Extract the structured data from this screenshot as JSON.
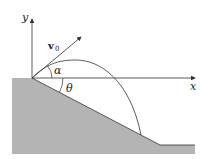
{
  "diagram": {
    "labels": {
      "y_axis": "y",
      "x_axis": "x",
      "velocity": "v",
      "velocity_subscript": "0",
      "launch_angle": "α",
      "slope_angle": "θ"
    },
    "colors": {
      "ground_fill": "#b4b4b4",
      "lines": "#333333",
      "background": "#ffffff"
    }
  }
}
